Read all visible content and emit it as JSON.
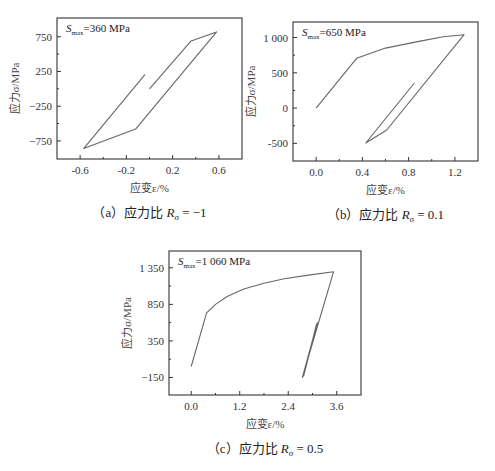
{
  "chart_data": [
    {
      "id": "a",
      "type": "line",
      "title": "",
      "caption": {
        "prefix": "（a）应力比 ",
        "symbol": "R",
        "sub": "σ",
        "suffix": " = −1"
      },
      "annotation": {
        "s": "S",
        "sub": "max",
        "rest": "=360 MPa"
      },
      "xlabel": "应变ε/%",
      "ylabel": "应力σ/MPa",
      "xlim": [
        -0.8,
        0.8
      ],
      "ylim": [
        -1010,
        1020
      ],
      "xticks": [
        -0.6,
        -0.2,
        0.2,
        0.6
      ],
      "xtick_labels": [
        "-0.6",
        "-0.2",
        "0.2",
        "0.6"
      ],
      "yticks": [
        750,
        250,
        -250,
        -750
      ],
      "ytick_labels": [
        "750",
        "250",
        "−250",
        "−750"
      ],
      "grid": false,
      "frame": {
        "x": 57,
        "y": 18,
        "w": 185,
        "h": 141
      },
      "series": [
        {
          "name": "stress-strain",
          "x": [
            0.0,
            0.36,
            0.58,
            -0.12,
            -0.57,
            -0.04
          ],
          "y": [
            0,
            690,
            820,
            -580,
            -860,
            205
          ]
        }
      ]
    },
    {
      "id": "b",
      "type": "line",
      "title": "",
      "caption": {
        "prefix": "（b）应力比 ",
        "symbol": "R",
        "sub": "σ",
        "suffix": " = 0.1"
      },
      "annotation": {
        "s": "S",
        "sub": "max",
        "rest": "=650 MPa"
      },
      "xlabel": "应变ε/%",
      "ylabel": "应力σ/MPa",
      "xlim": [
        -0.2,
        1.4
      ],
      "ylim": [
        -750,
        1220
      ],
      "xticks": [
        0.0,
        0.4,
        0.8,
        1.2
      ],
      "xtick_labels": [
        "0.0",
        "0.4",
        "0.8",
        "1.2"
      ],
      "yticks": [
        1000,
        500,
        0,
        -500
      ],
      "ytick_labels": [
        "1 000",
        "500",
        "0",
        "-500"
      ],
      "grid": false,
      "frame": {
        "x": 293,
        "y": 22,
        "w": 185,
        "h": 139
      },
      "series": [
        {
          "name": "stress-strain",
          "x": [
            0.0,
            0.35,
            0.6,
            0.9,
            1.1,
            1.28,
            0.61,
            0.43,
            0.85
          ],
          "y": [
            0,
            705,
            850,
            950,
            1010,
            1040,
            -310,
            -495,
            355
          ]
        }
      ]
    },
    {
      "id": "c",
      "type": "line",
      "title": "",
      "caption": {
        "prefix": "（c）应力比 ",
        "symbol": "R",
        "sub": "σ",
        "suffix": " = 0.5"
      },
      "annotation": {
        "s": "S",
        "sub": "max",
        "rest": "=1 060 MPa"
      },
      "xlabel": "应变ε/%",
      "ylabel": "应力σ/MPa",
      "xlim": [
        -0.55,
        4.2
      ],
      "ylim": [
        -390,
        1580
      ],
      "xticks": [
        0.0,
        1.2,
        2.4,
        3.6
      ],
      "xtick_labels": [
        "0.0",
        "1.2",
        "2.4",
        "3.6"
      ],
      "yticks": [
        1350,
        850,
        350,
        -150
      ],
      "ytick_labels": [
        "1 350",
        "850",
        "350",
        "−150"
      ],
      "grid": false,
      "frame": {
        "x": 169,
        "y": 251,
        "w": 192,
        "h": 144
      },
      "series": [
        {
          "name": "stress-strain",
          "x": [
            0.0,
            0.38,
            0.6,
            0.9,
            1.3,
            1.8,
            2.3,
            2.9,
            3.52,
            2.75,
            3.12,
            2.78,
            3.1
          ],
          "y": [
            0,
            735,
            850,
            960,
            1060,
            1140,
            1200,
            1250,
            1295,
            -150,
            600,
            -130,
            580
          ]
        }
      ]
    }
  ]
}
